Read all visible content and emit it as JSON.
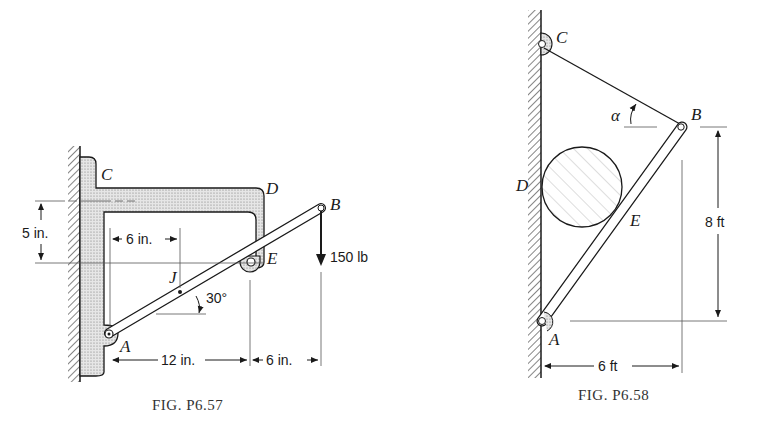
{
  "figures": [
    {
      "id": "fig1",
      "caption": "Fig. P6.57",
      "caption_display": "FIG. P6.57",
      "points": {
        "A": "A",
        "B": "B",
        "C": "C",
        "D": "D",
        "E": "E",
        "J": "J"
      },
      "dimensions": {
        "vertical": "5 in.",
        "jdist": "6 in.",
        "ae": "12 in.",
        "eb": "6 in."
      },
      "angle": "30°",
      "load": "150 lb"
    },
    {
      "id": "fig2",
      "caption": "Fig. P6.58",
      "caption_display": "FIG. P6.58",
      "points": {
        "A": "A",
        "B": "B",
        "C": "C",
        "D": "D",
        "E": "E"
      },
      "angle_symbol": "α",
      "dimensions": {
        "height": "8 ft",
        "width": "6 ft"
      }
    }
  ],
  "colors": {
    "ink": "#1a1a1a",
    "fill_stipple": "#d8d8d8",
    "background": "#ffffff"
  }
}
